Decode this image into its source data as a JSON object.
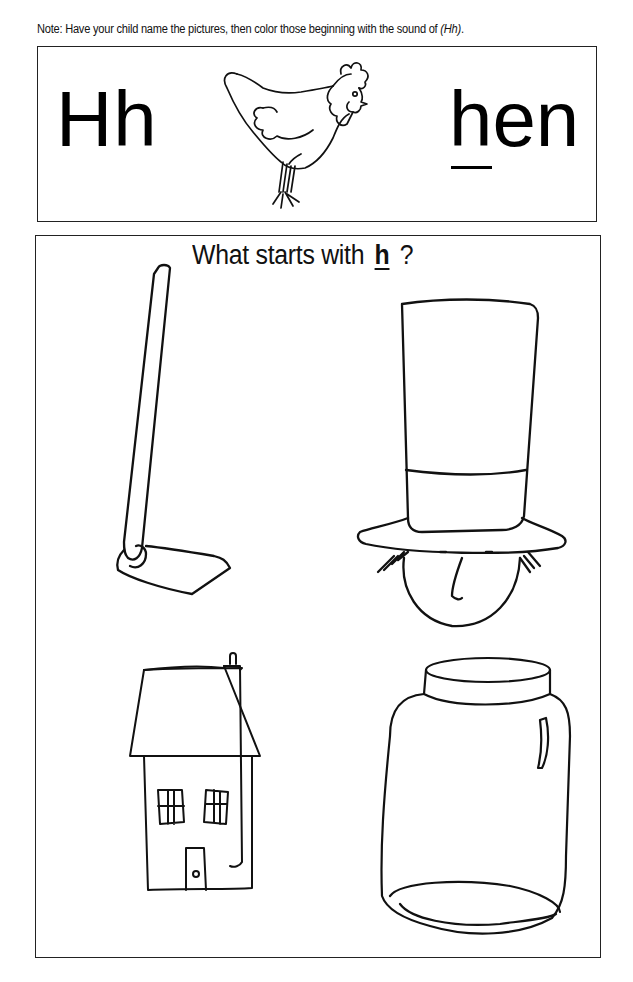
{
  "worksheet": {
    "note": {
      "prefix": "Note: Have your child name the pictures, then color those beginning with the sound of ",
      "sound": "(Hh)",
      "suffix": "."
    },
    "header_box": {
      "letters": "Hh",
      "example_picture": "hen-icon",
      "example_word_first": "h",
      "example_word_rest": "en"
    },
    "main_box": {
      "question_prefix": "What starts with ",
      "question_letter": "h",
      "question_suffix": " ?",
      "pictures": [
        {
          "name": "hoe",
          "icon": "hoe-icon",
          "position": "top-left"
        },
        {
          "name": "hat",
          "icon": "top-hat-icon",
          "position": "top-right"
        },
        {
          "name": "house",
          "icon": "house-icon",
          "position": "bottom-left"
        },
        {
          "name": "jar",
          "icon": "jar-icon",
          "position": "bottom-right"
        }
      ]
    },
    "colors": {
      "ink": "#111111",
      "paper": "#ffffff",
      "border": "#222222"
    }
  }
}
